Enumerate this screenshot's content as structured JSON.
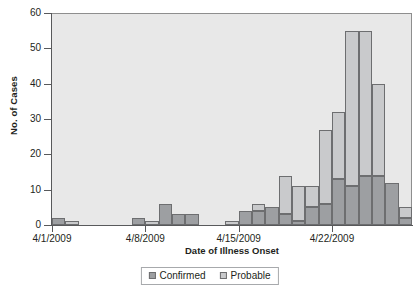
{
  "chart_data": {
    "type": "bar",
    "subtype": "stacked-bar-epidemic-curve",
    "title": "",
    "xlabel": "Date of Illness Onset",
    "ylabel": "No. of Cases",
    "ylim": [
      0,
      60
    ],
    "yticks": [
      0,
      10,
      20,
      30,
      40,
      50,
      60
    ],
    "grid": false,
    "legend_position": "bottom-center",
    "x_tick_labels": [
      "4/1/2009",
      "4/8/2009",
      "4/15/2009",
      "4/22/2009"
    ],
    "x_tick_dates": [
      "4/1/2009",
      "4/8/2009",
      "4/15/2009",
      "4/22/2009"
    ],
    "categories": [
      "4/1/2009",
      "4/2/2009",
      "4/3/2009",
      "4/4/2009",
      "4/5/2009",
      "4/6/2009",
      "4/7/2009",
      "4/8/2009",
      "4/9/2009",
      "4/10/2009",
      "4/11/2009",
      "4/12/2009",
      "4/13/2009",
      "4/14/2009",
      "4/15/2009",
      "4/16/2009",
      "4/17/2009",
      "4/18/2009",
      "4/19/2009",
      "4/20/2009",
      "4/21/2009",
      "4/22/2009",
      "4/23/2009",
      "4/24/2009",
      "4/25/2009",
      "4/26/2009",
      "4/27/2009"
    ],
    "series": [
      {
        "name": "Confirmed",
        "color": "#9d9fa2",
        "values": [
          2,
          0,
          0,
          0,
          0,
          0,
          2,
          0,
          6,
          3,
          3,
          0,
          0,
          0,
          4,
          4,
          5,
          3,
          1,
          5,
          6,
          13,
          11,
          14,
          14,
          12,
          2
        ]
      },
      {
        "name": "Probable",
        "color": "#c9cacc",
        "values": [
          0,
          1,
          0,
          0,
          0,
          0,
          0,
          1,
          0,
          0,
          0,
          0,
          0,
          1,
          0,
          2,
          0,
          11,
          10,
          6,
          21,
          19,
          44,
          41,
          26,
          0,
          3
        ]
      }
    ],
    "totals": [
      2,
      1,
      0,
      0,
      0,
      0,
      2,
      1,
      6,
      3,
      3,
      0,
      0,
      1,
      4,
      6,
      5,
      14,
      11,
      11,
      27,
      32,
      55,
      55,
      40,
      12,
      5
    ]
  },
  "axis": {
    "y_title": "No. of Cases",
    "x_title": "Date of Illness Onset"
  },
  "legend": {
    "items": [
      {
        "label": "Confirmed",
        "color": "#9d9fa2"
      },
      {
        "label": "Probable",
        "color": "#c9cacc"
      }
    ]
  }
}
